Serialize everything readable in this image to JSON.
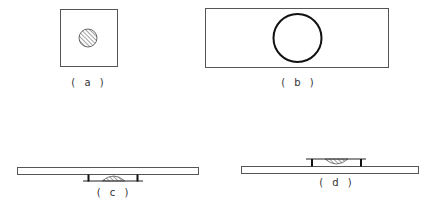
{
  "figure": {
    "colors": {
      "ink": "#222222",
      "plate_stroke": "#555555",
      "background": "#ffffff"
    },
    "panels": [
      {
        "id": "a",
        "label": "( a )",
        "content": "square slide top view with small hatched circular droplet"
      },
      {
        "id": "b",
        "label": "( b )",
        "content": "rectangular slide top view with large bold circle"
      },
      {
        "id": "c",
        "label": "( c )",
        "content": "side view: plate above, spacers below with sitting hatched droplet"
      },
      {
        "id": "d",
        "label": "( d )",
        "content": "side view: plate below, spacers above with hanging hatched droplet"
      }
    ]
  }
}
